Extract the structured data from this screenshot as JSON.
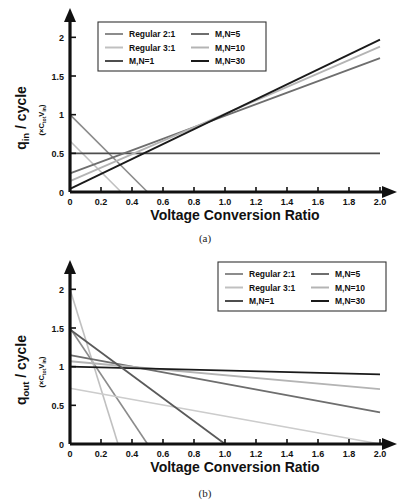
{
  "figure": {
    "panels": [
      {
        "caption": "(a)",
        "ylabel_main": "q",
        "ylabel_sub": "in",
        "ylabel_rest": " / cycle",
        "ylabel_units": "(×C",
        "ylabel_units_sub1": "tot",
        "ylabel_units_mid": "V",
        "ylabel_units_sub2": "in",
        "ylabel_units_end": ")",
        "xlabel": "Voltage Conversion Ratio",
        "legend_position": "top-left"
      },
      {
        "caption": "(b)",
        "ylabel_main": "q",
        "ylabel_sub": "out",
        "ylabel_rest": " / cycle",
        "ylabel_units": "(×C",
        "ylabel_units_sub1": "tot",
        "ylabel_units_mid": "V",
        "ylabel_units_sub2": "in",
        "ylabel_units_end": ")",
        "xlabel": "Voltage Conversion Ratio",
        "legend_position": "top-right"
      }
    ]
  },
  "chart_data": [
    {
      "type": "line",
      "panel": "(a)",
      "title": "",
      "xlabel": "Voltage Conversion Ratio",
      "ylabel": "q_in / cycle  (×C_tot V_in)",
      "xlim": [
        0,
        2.0
      ],
      "ylim": [
        0,
        2.25
      ],
      "xticks": [
        "0",
        "0.2",
        "0.4",
        "0.6",
        "0.8",
        "1.0",
        "1.2",
        "1.4",
        "1.6",
        "1.8",
        "2.0"
      ],
      "xtick_values": [
        0,
        0.2,
        0.4,
        0.6,
        0.8,
        1.0,
        1.2,
        1.4,
        1.6,
        1.8,
        2.0
      ],
      "yticks": [
        "0",
        "0.5",
        "1",
        "1.5",
        "2"
      ],
      "ytick_values": [
        0,
        0.5,
        1,
        1.5,
        2
      ],
      "grid": false,
      "legend_position": "top-left",
      "series": [
        {
          "name": "Regular 2:1",
          "color": "#8c8c8c",
          "width": 1.6,
          "points": [
            [
              0,
              1.0
            ],
            [
              0.5,
              0.0
            ]
          ]
        },
        {
          "name": "Regular 3:1",
          "color": "#c0c0c0",
          "width": 1.6,
          "points": [
            [
              0,
              0.66
            ],
            [
              0.33,
              0.0
            ]
          ]
        },
        {
          "name": "M,N=1",
          "color": "#4d4d4d",
          "width": 1.8,
          "points": [
            [
              0,
              0.5
            ],
            [
              2.0,
              0.5
            ]
          ]
        },
        {
          "name": "M,N=5",
          "color": "#6e6e6e",
          "width": 1.8,
          "points": [
            [
              0,
              0.24
            ],
            [
              2.0,
              1.73
            ]
          ]
        },
        {
          "name": "M,N=10",
          "color": "#b4b4b4",
          "width": 1.8,
          "points": [
            [
              0,
              0.14
            ],
            [
              2.0,
              1.88
            ]
          ]
        },
        {
          "name": "M,N=30",
          "color": "#1a1a1a",
          "width": 1.8,
          "points": [
            [
              0,
              0.04
            ],
            [
              2.0,
              1.97
            ]
          ]
        }
      ]
    },
    {
      "type": "line",
      "panel": "(b)",
      "title": "",
      "xlabel": "Voltage Conversion Ratio",
      "ylabel": "q_out / cycle  (×C_tot V_in)",
      "xlim": [
        0,
        2.0
      ],
      "ylim": [
        0,
        2.25
      ],
      "xticks": [
        "0",
        "0.2",
        "0.4",
        "0.6",
        "0.8",
        "1.0",
        "1.2",
        "1.4",
        "1.6",
        "1.8",
        "2.0"
      ],
      "xtick_values": [
        0,
        0.2,
        0.4,
        0.6,
        0.8,
        1.0,
        1.2,
        1.4,
        1.6,
        1.8,
        2.0
      ],
      "yticks": [
        "0",
        "0.5",
        "1",
        "1.5",
        "2"
      ],
      "ytick_values": [
        0,
        0.5,
        1,
        1.5,
        2
      ],
      "grid": false,
      "legend_position": "top-right",
      "series": [
        {
          "name": "Regular 2:1",
          "color": "#8c8c8c",
          "width": 1.6,
          "points": [
            [
              0,
              1.5
            ],
            [
              0.5,
              0.0
            ]
          ]
        },
        {
          "name": "Regular 3:1",
          "color": "#c0c0c0",
          "width": 1.6,
          "points": [
            [
              0,
              2.0
            ],
            [
              0.31,
              0.0
            ]
          ]
        },
        {
          "name": "M,N=1",
          "color": "#cccccc",
          "width": 1.6,
          "points": [
            [
              0,
              0.72
            ],
            [
              2.0,
              0.0
            ]
          ]
        },
        {
          "name": "M,N=5",
          "color": "#6e6e6e",
          "width": 1.8,
          "points": [
            [
              0,
              1.15
            ],
            [
              2.0,
              0.41
            ]
          ]
        },
        {
          "name": "M,N=10",
          "color": "#b4b4b4",
          "width": 1.8,
          "points": [
            [
              0,
              1.07
            ],
            [
              2.0,
              0.71
            ]
          ]
        },
        {
          "name": "M,N=30",
          "color": "#1a1a1a",
          "width": 1.8,
          "points": [
            [
              0,
              1.0
            ],
            [
              2.0,
              0.9
            ]
          ]
        }
      ],
      "extra_series": [
        {
          "name": "M,N=1 descending",
          "color": "#5a5a5a",
          "width": 1.8,
          "points": [
            [
              0,
              1.48
            ],
            [
              1.0,
              0.0
            ]
          ]
        }
      ]
    }
  ],
  "legend": {
    "entries": [
      {
        "label": "Regular 2:1",
        "color": "#8c8c8c"
      },
      {
        "label": "Regular 3:1",
        "color": "#c0c0c0"
      },
      {
        "label": "M,N=1",
        "color": "#4d4d4d"
      },
      {
        "label": "M,N=5",
        "color": "#6e6e6e"
      },
      {
        "label": "M,N=10",
        "color": "#b4b4b4"
      },
      {
        "label": "M,N=30",
        "color": "#1a1a1a"
      }
    ]
  }
}
